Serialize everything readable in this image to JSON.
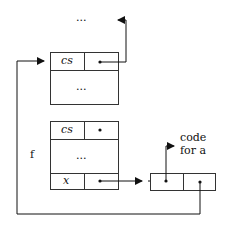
{
  "diagram": {
    "top_ellipsis": "...",
    "frame_top": {
      "slot_name": "cs",
      "body": "..."
    },
    "frame_bottom": {
      "label": "f",
      "slot_cs": "cs",
      "body": "...",
      "slot_x": "x"
    },
    "closure": {
      "code_label_line1": "code",
      "code_label_line2": "for a"
    }
  }
}
